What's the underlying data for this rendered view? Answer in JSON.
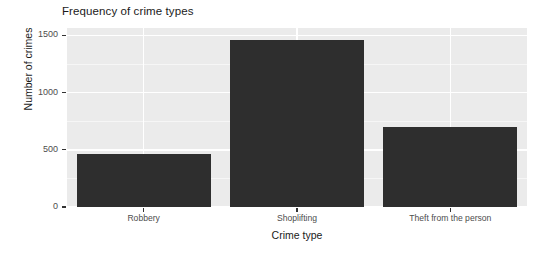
{
  "chart_data": {
    "type": "bar",
    "title": "Frequency of crime types",
    "xlabel": "Crime type",
    "ylabel": "Number of crimes",
    "categories": [
      "Robbery",
      "Shoplifting",
      "Theft from the person"
    ],
    "values": [
      460,
      1460,
      700
    ],
    "ytick_labels": [
      "0",
      "500",
      "1000",
      "1500"
    ],
    "ytick_values": [
      0,
      500,
      1000,
      1500
    ],
    "yminor_values": [
      250,
      750,
      1250
    ],
    "ylim": [
      0,
      1565
    ],
    "grid": true,
    "legend": "none",
    "colors": {
      "bar": "#2e2e2e",
      "panel_background": "#ebebeb",
      "gridline_major": "#ffffff",
      "gridline_minor": "#f6f6f6",
      "text": "#1a1a1a",
      "tick_text": "#4d4d4d",
      "figure_background": "#ffffff"
    }
  }
}
